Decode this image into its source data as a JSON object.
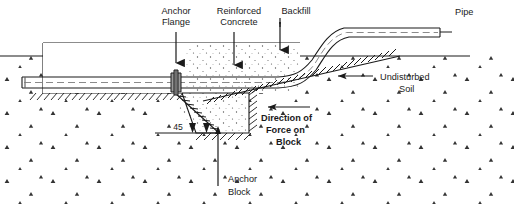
{
  "figure": {
    "type": "engineering-cross-section-diagram",
    "background_color": "#ffffff",
    "line_color": "#1a1a1a",
    "flange_fill": "#9a9a9a",
    "stipple_color": "#4a4a4a"
  },
  "labels": {
    "anchor_flange": {
      "line1": "Anchor",
      "line2": "Flange"
    },
    "reinforced_concrete": {
      "line1": "Reinforced",
      "line2": "Concrete"
    },
    "backfill": {
      "line1": "Backfill"
    },
    "pipe": {
      "line1": "Pipe"
    },
    "undisturbed_soil": {
      "line1": "Undisturbed",
      "line2": "Soil"
    },
    "direction_of_force": {
      "line1": "Direction of",
      "line2": "Force on",
      "line3": "Block"
    },
    "anchor_block": {
      "line1": "Anchor",
      "line2": "Block"
    },
    "angle": {
      "value": "45"
    }
  },
  "icons": {
    "leader_arrow": "arrow-down-icon",
    "force_arrow": "arrow-left-icon",
    "soil_arrow": "arrow-left-icon",
    "anchor_block_arrow": "arrow-up-icon",
    "angle_arrow": "arrow-icon"
  }
}
